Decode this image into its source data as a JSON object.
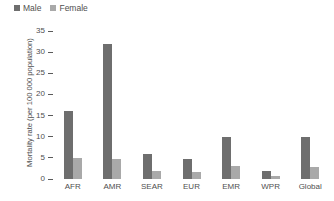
{
  "chart_data": {
    "type": "bar",
    "title": "",
    "subtitle": "",
    "xlabel": "",
    "ylabel": "Mortality rate (per 100 000 population)",
    "categories": [
      "AFR",
      "AMR",
      "SEAR",
      "EUR",
      "EMR",
      "WPR",
      "Global"
    ],
    "series": [
      {
        "name": "Male",
        "color": "#6e6e6e",
        "values": [
          16,
          32,
          6,
          4.8,
          10,
          2,
          10
        ]
      },
      {
        "name": "Female",
        "color": "#a9a9a9",
        "values": [
          5,
          4.8,
          2,
          1.7,
          3,
          0.6,
          2.8
        ]
      }
    ],
    "ylim": [
      0,
      35
    ],
    "yticks": [
      0,
      5,
      10,
      15,
      20,
      25,
      30,
      35
    ],
    "ytick_labels": [
      "0",
      "5",
      "10",
      "15",
      "20",
      "25",
      "30",
      "35"
    ],
    "grid": false,
    "legend_position": "top-left",
    "legend": [
      {
        "label": "Male",
        "swatch": "square-marker",
        "color": "#6e6e6e"
      },
      {
        "label": "Female",
        "swatch": "square-marker",
        "color": "#a9a9a9"
      }
    ]
  }
}
